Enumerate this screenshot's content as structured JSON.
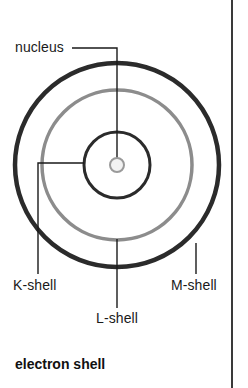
{
  "figure": {
    "caption": "electron shell",
    "background_color": "#ffffff",
    "text_color": "#1a1a1a",
    "border_color": "#3a3a3a"
  },
  "diagram": {
    "type": "concentric-shell-diagram",
    "center": {
      "x": 117,
      "y": 165
    },
    "nucleus": {
      "label": "nucleus",
      "radius": 7,
      "stroke_color": "#9a9a9a",
      "fill_color": "#f2f2f2",
      "stroke_width": 2
    },
    "shells": [
      {
        "label": "K-shell",
        "name": "k-shell",
        "radius": 33,
        "stroke_color": "#2b2b2b",
        "stroke_width": 3
      },
      {
        "label": "L-shell",
        "name": "l-shell",
        "radius": 75,
        "stroke_color": "#8c8c8c",
        "stroke_width": 3.5
      },
      {
        "label": "M-shell",
        "name": "m-shell",
        "radius": 102,
        "stroke_color": "#2b2b2b",
        "stroke_width": 4.5
      }
    ],
    "leader_color": "#1a1a1a",
    "leader_width": 1.4
  }
}
